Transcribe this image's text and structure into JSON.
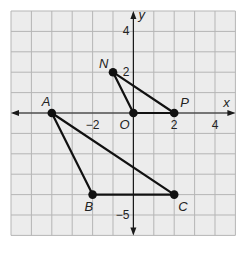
{
  "figure": {
    "type": "coordinate-plane",
    "grid": {
      "x_min": -6,
      "x_max": 5,
      "y_min": -6,
      "y_max": 5,
      "unit": 1
    },
    "colors": {
      "background": "#ececec",
      "gridline": "#b5b5b5",
      "axis": "#1a1a1a",
      "segment": "#111111",
      "point": "#111111"
    },
    "axes": {
      "x_label": "x",
      "y_label": "y",
      "x_ticks": [
        {
          "value": -2,
          "label": "−2"
        },
        {
          "value": 2,
          "label": "2"
        },
        {
          "value": 4,
          "label": "4"
        }
      ],
      "y_ticks": [
        {
          "value": 4,
          "label": "4"
        },
        {
          "value": 2,
          "label": "2"
        },
        {
          "value": -5,
          "label": "−5"
        }
      ]
    },
    "points": [
      {
        "name": "A",
        "x": -4,
        "y": 0
      },
      {
        "name": "B",
        "x": -2,
        "y": -4
      },
      {
        "name": "C",
        "x": 2,
        "y": -4
      },
      {
        "name": "N",
        "x": -1,
        "y": 2
      },
      {
        "name": "O",
        "x": 0,
        "y": 0
      },
      {
        "name": "P",
        "x": 2,
        "y": 0
      }
    ],
    "triangles": [
      {
        "name": "ABC",
        "vertices": [
          "A",
          "B",
          "C"
        ]
      },
      {
        "name": "NOP",
        "vertices": [
          "N",
          "O",
          "P"
        ]
      }
    ]
  }
}
